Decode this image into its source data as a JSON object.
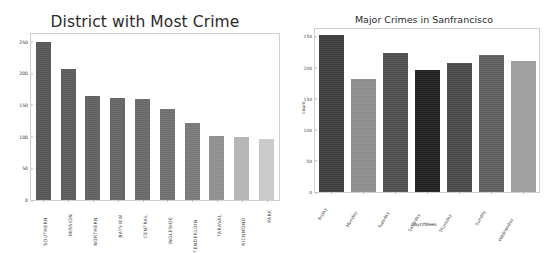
{
  "chart_data": [
    {
      "type": "bar",
      "title": "District with Most Crime",
      "xlabel": "",
      "ylabel": "",
      "ylim": [
        0,
        262
      ],
      "yticks": [
        0,
        50,
        100,
        150,
        200,
        250
      ],
      "grid": false,
      "legend": "none",
      "categories": [
        "SOUTHERN",
        "MISSION",
        "NORTHERN",
        "BAYVIEW",
        "CENTRAL",
        "INGLESIDE",
        "TENDERLOIN",
        "TARAVAL",
        "RICHMOND",
        "PARK"
      ],
      "values": [
        249,
        206,
        164,
        161,
        159,
        143,
        122,
        101,
        99,
        96
      ],
      "colors": [
        "#565656",
        "#5b5b5b",
        "#606060",
        "#646464",
        "#686868",
        "#6f6f6f",
        "#787878",
        "#8f8f8f",
        "#b4b4b4",
        "#c9c9c9"
      ]
    },
    {
      "type": "bar",
      "title": "Major Crimes in Sanfrancisco",
      "xlabel": "DayOfWeek",
      "ylabel": "count",
      "ylim": [
        0,
        262
      ],
      "yticks": [
        0,
        50,
        100,
        150,
        200,
        250
      ],
      "grid": false,
      "legend": "none",
      "categories": [
        "Friday",
        "Monday",
        "Tuesday",
        "Saturday",
        "Thursday",
        "Sunday",
        "Wednesday"
      ],
      "values": [
        253,
        182,
        223,
        196,
        207,
        221,
        210
      ],
      "colors": [
        "#3c3c3c",
        "#8c8c8c",
        "#4f4f4f",
        "#202020",
        "#484848",
        "#5e5e5e",
        "#9d9d9d"
      ]
    }
  ]
}
